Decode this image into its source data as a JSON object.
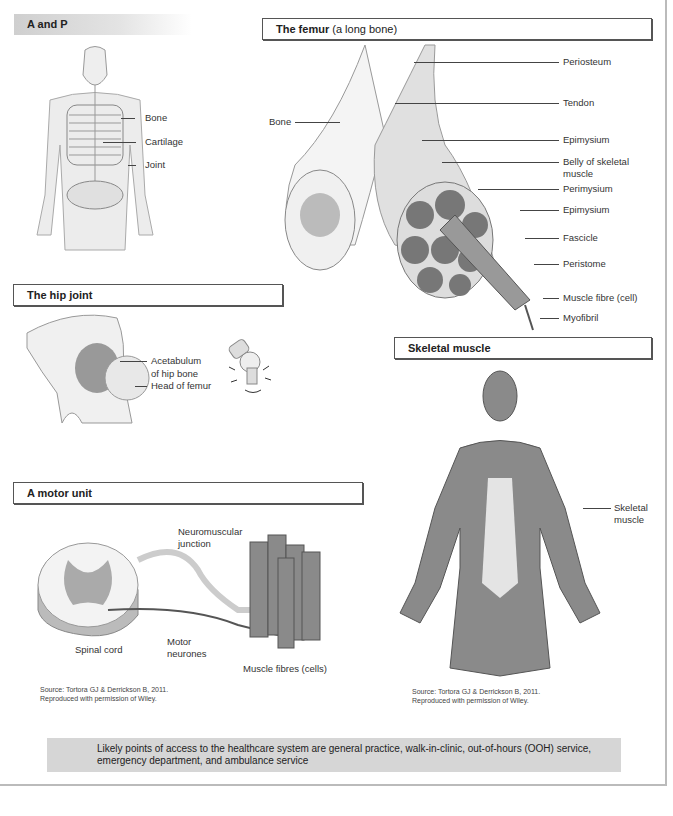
{
  "sections": {
    "a_and_p": {
      "title": "A and P",
      "labels": [
        "Bone",
        "Cartilage",
        "Joint"
      ]
    },
    "femur": {
      "title_bold": "The femur",
      "title_rest": " (a long bone)",
      "left_label": "Bone",
      "labels": [
        "Periosteum",
        "Tendon",
        "Epimysium",
        "Belly of skeletal",
        "muscle",
        "Perimysium",
        "Epimysium",
        "Fascicle",
        "Peristome",
        "Muscle fibre (cell)",
        "Myofibril"
      ]
    },
    "hip_joint": {
      "title": "The hip joint",
      "labels": [
        "Acetabulum",
        "of hip bone",
        "Head of femur"
      ]
    },
    "skeletal_muscle": {
      "title": "Skeletal muscle",
      "labels": [
        "Skeletal",
        "muscle"
      ],
      "source_line1": "Source: Tortora GJ & Derrickson B, 2011.",
      "source_line2": "Reproduced with permission of Wiley."
    },
    "motor_unit": {
      "title": "A motor unit",
      "labels": {
        "nmj1": "Neuromuscular",
        "nmj2": "junction",
        "spinal": "Spinal cord",
        "motor1": "Motor",
        "motor2": "neurones",
        "fibres": "Muscle fibres (cells)"
      },
      "source_line1": "Source: Tortora GJ & Derrickson B, 2011.",
      "source_line2": "Reproduced with permission of Wiley."
    }
  },
  "note": {
    "line1": "Likely points of access to the healthcare system are general practice, walk-in-clinic, out-of-hours (OOH) service,",
    "line2": "emergency department, and ambulance service"
  },
  "colors": {
    "header_gray": "#cfcfcf",
    "note_bg": "#d6d6d6",
    "muscle_gray": "#8a8a8a"
  }
}
